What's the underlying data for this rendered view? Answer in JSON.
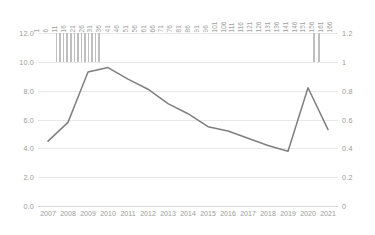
{
  "chart_data": {
    "type": "line",
    "title": "",
    "subtitle": "",
    "xlabel": "",
    "ylabel": "",
    "grid": true,
    "legend": "none",
    "categories": [
      "2007",
      "2008",
      "2009",
      "2010",
      "2011",
      "2012",
      "2013",
      "2014",
      "2015",
      "2016",
      "2017",
      "2018",
      "2019",
      "2020",
      "2021"
    ],
    "series": [
      {
        "name": "line-series",
        "axis": "left",
        "color": "#7f7f7f",
        "values": [
          4.5,
          5.8,
          9.3,
          9.6,
          8.8,
          8.1,
          7.1,
          6.4,
          5.5,
          5.2,
          4.7,
          4.2,
          3.8,
          8.2,
          5.3
        ]
      },
      {
        "name": "bar-series",
        "axis": "right",
        "color": "#bfbfbf",
        "note": "thin vertical bars clipped at top of plot area",
        "x_positions": [
          11,
          13,
          15,
          17,
          19,
          21,
          23,
          25,
          27,
          29,
          31,
          33,
          35,
          156,
          159
        ],
        "values": [
          1.2,
          1.2,
          1.2,
          1.2,
          1.2,
          1.2,
          1.2,
          1.2,
          1.2,
          1.2,
          1.2,
          1.2,
          1.2,
          1.2,
          1.2
        ]
      }
    ],
    "ylim_left": [
      0,
      12
    ],
    "ylim_right": [
      0,
      1.2
    ],
    "yticks_left": [
      "12.0",
      "10.0",
      "8.0",
      "6.0",
      "4.0",
      "2.0",
      "0.0"
    ],
    "yticks_right": [
      "1.2",
      "1",
      "0.8",
      "0.6",
      "0.4",
      "0.2",
      "0"
    ],
    "top_axis": {
      "label": "index",
      "ticks": [
        "1",
        "6",
        "11",
        "16",
        "21",
        "26",
        "31",
        "36",
        "41",
        "46",
        "51",
        "56",
        "61",
        "66",
        "71",
        "76",
        "81",
        "86",
        "91",
        "96",
        "101",
        "106",
        "111",
        "116",
        "121",
        "126",
        "131",
        "136",
        "141",
        "146",
        "151",
        "156",
        "161",
        "166"
      ],
      "range": [
        1,
        170
      ]
    },
    "colors": {
      "line": "#7f7f7f",
      "bar": "#bfbfbf",
      "grid": "#e8e8e8",
      "tick_text": "#9a9a9a",
      "background": "#ffffff"
    }
  }
}
